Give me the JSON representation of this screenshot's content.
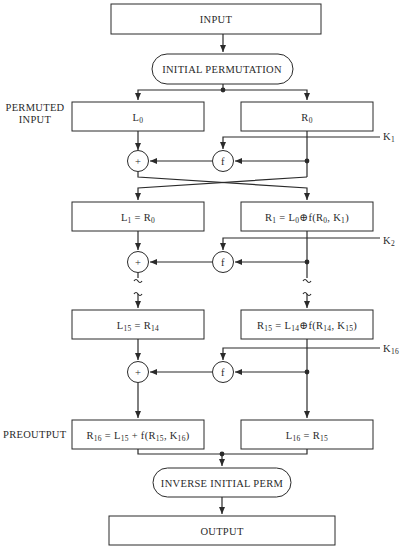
{
  "blocks": {
    "input": "INPUT",
    "initial_permutation": "INITIAL PERMUTATION",
    "inverse_initial_perm": "INVERSE INITIAL PERM",
    "output": "OUTPUT"
  },
  "side_labels": {
    "permuted_input_line1": "PERMUTED",
    "permuted_input_line2": "INPUT",
    "preoutput": "PREOUTPUT"
  },
  "rounds": [
    {
      "left": {
        "base": "L",
        "sub": "0",
        "eq": ""
      },
      "right": {
        "base": "R",
        "sub": "0",
        "eq": ""
      },
      "key": {
        "base": "K",
        "sub": "1"
      }
    },
    {
      "left": {
        "text_a": "L",
        "sub_a": "1",
        "mid": " = R",
        "sub_b": "0"
      },
      "right": {
        "text_a": "R",
        "sub_a": "1",
        "mid": " = L",
        "sub_b": "0",
        "xor": "⊕",
        "tail_a": "f(R",
        "sub_c": "0",
        "tail_b": ", K",
        "sub_d": "1",
        "tail_c": ")"
      },
      "key": {
        "base": "K",
        "sub": "2"
      }
    },
    {
      "left": {
        "text_a": "L",
        "sub_a": "15",
        "mid": " = R",
        "sub_b": "14"
      },
      "right": {
        "text_a": "R",
        "sub_a": "15",
        "mid": " = L",
        "sub_b": "14",
        "xor": "⊕",
        "tail_a": "f(R",
        "sub_c": "14",
        "tail_b": ", K",
        "sub_d": "15",
        "tail_c": ")"
      },
      "key": {
        "base": "K",
        "sub": "16"
      }
    },
    {
      "left": {
        "text_a": "R",
        "sub_a": "16",
        "mid": " = L",
        "sub_b": "15",
        "tail_a": " + f(R",
        "sub_c": "15",
        "tail_b": ", K",
        "sub_d": "16",
        "tail_c": ")"
      },
      "right": {
        "text_a": "L",
        "sub_a": "16",
        "mid": " = R",
        "sub_b": "15"
      }
    }
  ],
  "operators": {
    "xor": "+",
    "f": "f"
  },
  "break_mark": "~"
}
